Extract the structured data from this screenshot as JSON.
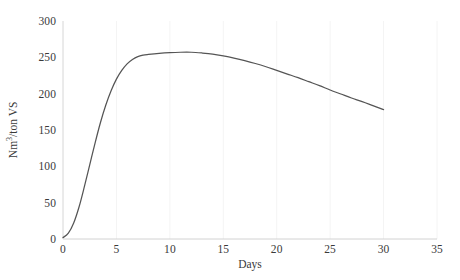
{
  "chart_data": {
    "type": "line",
    "title": "",
    "xlabel": "Days",
    "ylabel_parts": {
      "pre": "Nm",
      "sup": "3",
      "post": "/ton VS"
    },
    "ylabel": "Nm3/ton VS",
    "xlim": [
      0,
      35
    ],
    "ylim": [
      0,
      300
    ],
    "xticks": [
      0,
      5,
      10,
      15,
      20,
      25,
      30,
      35
    ],
    "xtick_labels": [
      "0",
      "5",
      "10",
      "15",
      "20",
      "25",
      "30",
      "35"
    ],
    "yticks": [
      0,
      50,
      100,
      150,
      200,
      250,
      300
    ],
    "ytick_labels": [
      "0",
      "50",
      "100",
      "150",
      "200",
      "250",
      "300"
    ],
    "grid": "faint vertical gridlines at x ticks",
    "legend": "none",
    "line_color": "#555555",
    "axis_color": "#d8d8d8",
    "series": [
      {
        "name": "Cumulative biogas yield",
        "x": [
          0,
          0.5,
          1,
          1.5,
          2,
          2.5,
          3,
          3.5,
          4,
          4.5,
          5,
          5.5,
          6,
          6.5,
          7,
          7.5,
          8,
          9,
          10,
          11,
          12,
          13,
          14,
          15,
          16,
          17,
          18,
          19,
          20,
          21,
          22,
          23,
          24,
          25,
          26,
          27,
          28,
          29,
          30
        ],
        "values": [
          2,
          8,
          22,
          44,
          72,
          102,
          132,
          160,
          184,
          204,
          220,
          232,
          241,
          247,
          251,
          253,
          254,
          255.5,
          256.5,
          257,
          257,
          256,
          254.5,
          252,
          249,
          245.5,
          241.5,
          237,
          232,
          227,
          222,
          216.5,
          211,
          205,
          199.5,
          194,
          189,
          183.5,
          178
        ]
      }
    ]
  }
}
